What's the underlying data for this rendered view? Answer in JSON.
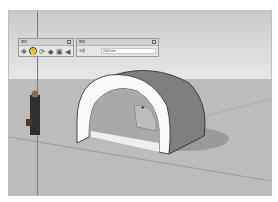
{
  "app": {
    "name": "SketchUp"
  },
  "toolbars": {
    "camera": {
      "title": "相机",
      "tools": [
        {
          "name": "orbit",
          "glyph": "✥"
        },
        {
          "name": "pan",
          "glyph": "✋",
          "active": true
        },
        {
          "name": "zoom",
          "glyph": "⟳"
        },
        {
          "name": "zoom-window",
          "glyph": "◆"
        },
        {
          "name": "zoom-extents",
          "glyph": "▣"
        },
        {
          "name": "previous",
          "glyph": "◀"
        }
      ]
    },
    "measurements": {
      "title": "数值",
      "label": "长度",
      "value": "2000 mm"
    }
  },
  "scene": {
    "model": "tunnel-arch",
    "cursor_label": "在面上"
  }
}
